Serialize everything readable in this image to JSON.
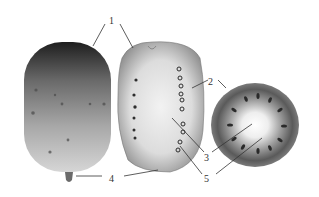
{
  "figure": {
    "colors": {
      "background": "#ffffff",
      "ink": "#333333",
      "skin_dark": "#1e1e1e",
      "skin_light": "#d2d2d2",
      "flesh": "#e6e6e6",
      "core": "#fafafa",
      "seed": "#2a2a2a"
    },
    "labels": [
      {
        "id": "1",
        "text": "1"
      },
      {
        "id": "2",
        "text": "2"
      },
      {
        "id": "3",
        "text": "3"
      },
      {
        "id": "4",
        "text": "4"
      },
      {
        "id": "5",
        "text": "5"
      }
    ],
    "parts": [
      {
        "name": "whole-fruit"
      },
      {
        "name": "longitudinal-section"
      },
      {
        "name": "cross-section"
      }
    ]
  }
}
